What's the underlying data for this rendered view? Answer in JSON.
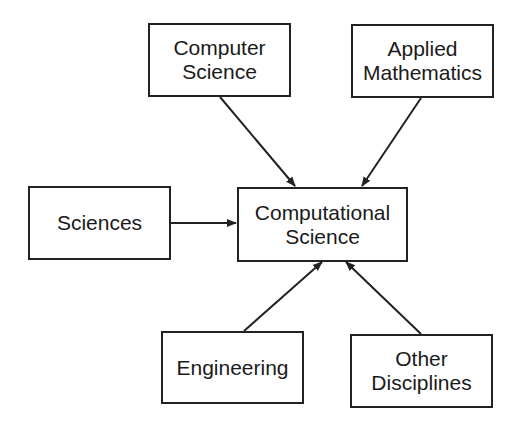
{
  "diagram": {
    "type": "flow",
    "nodes": [
      {
        "id": "computer_science",
        "lines": [
          "Computer",
          "Science"
        ]
      },
      {
        "id": "applied_mathematics",
        "lines": [
          "Applied",
          "Mathematics"
        ]
      },
      {
        "id": "sciences",
        "lines": [
          "Sciences"
        ]
      },
      {
        "id": "computational_science",
        "lines": [
          "Computational",
          "Science"
        ]
      },
      {
        "id": "engineering",
        "lines": [
          "Engineering"
        ]
      },
      {
        "id": "other_disciplines",
        "lines": [
          "Other",
          "Disciplines"
        ]
      }
    ],
    "edges": [
      {
        "from": "computer_science",
        "to": "computational_science"
      },
      {
        "from": "applied_mathematics",
        "to": "computational_science"
      },
      {
        "from": "sciences",
        "to": "computational_science"
      },
      {
        "from": "engineering",
        "to": "computational_science"
      },
      {
        "from": "other_disciplines",
        "to": "computational_science"
      }
    ]
  }
}
